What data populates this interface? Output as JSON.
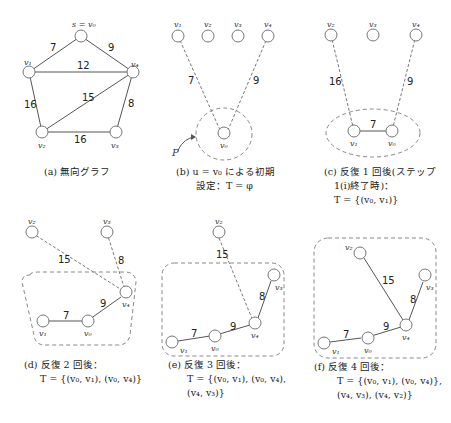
{
  "panels": {
    "a": {
      "caption": [
        "(a) 無向グラフ"
      ],
      "nodes": {
        "v0": "s = v₀",
        "v1": "v₁",
        "v2": "v₂",
        "v3": "v₃",
        "v4": "v₄"
      },
      "weights": {
        "v0v1": "7",
        "v0v4": "9",
        "v1v4": "12",
        "v2v4": "15",
        "v1v2": "16",
        "v2v3": "16",
        "v3v4": "8"
      }
    },
    "b": {
      "caption": [
        "(b) u = v₀ による初期",
        "設定：T = φ"
      ],
      "nodes": {
        "v0": "v₀",
        "v1": "v₁",
        "v2": "v₂",
        "v3": "v₃",
        "v4": "v₄"
      },
      "weights": {
        "v0v1": "7",
        "v0v4": "9"
      },
      "set_label": "P"
    },
    "c": {
      "caption": [
        "(c) 反復 1 回後(ステップ",
        "1(i)終了時)：",
        "T = {(v₀, v₁)}"
      ],
      "nodes": {
        "v0": "v₀",
        "v1": "v₁",
        "v2": "v₂",
        "v3": "v₃",
        "v4": "v₄"
      },
      "weights": {
        "v0v1": "7",
        "v1v2": "16",
        "v0v4": "9"
      }
    },
    "d": {
      "caption": [
        "(d) 反復 2 回後：",
        "T = {(v₀, v₁), (v₀, v₄)}"
      ],
      "nodes": {
        "v0": "v₀",
        "v1": "v₁",
        "v2": "v₂",
        "v3": "v₃",
        "v4": "v₄"
      },
      "weights": {
        "v0v1": "7",
        "v0v4": "9",
        "v2v4": "15",
        "v3v4": "8"
      }
    },
    "e": {
      "caption": [
        "(e) 反復 3 回後：",
        "T = {(v₀, v₁), (v₀, v₄),",
        "(v₄, v₃)}"
      ],
      "nodes": {
        "v0": "v₀",
        "v1": "v₁",
        "v2": "v₂",
        "v3": "v₃",
        "v4": "v₄"
      },
      "weights": {
        "v0v1": "7",
        "v0v4": "9",
        "v2v4": "15",
        "v3v4": "8"
      }
    },
    "f": {
      "caption": [
        "(f) 反復 4 回後：",
        "T = {(v₀, v₁), (v₀, v₄)},",
        "(v₄, v₃), (v₄, v₂)}"
      ],
      "nodes": {
        "v0": "v₀",
        "v1": "v₁",
        "v2": "v₂",
        "v3": "v₃",
        "v4": "v₄"
      },
      "weights": {
        "v0v1": "7",
        "v0v4": "9",
        "v2v4": "15",
        "v3v4": "8"
      }
    }
  }
}
